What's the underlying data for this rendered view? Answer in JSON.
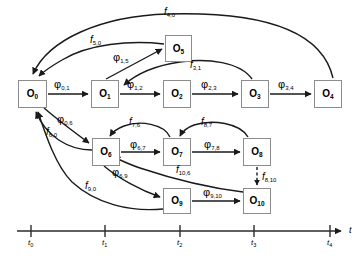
{
  "figure": {
    "type": "state-transition-diagram"
  },
  "nodes": [
    {
      "id": "O0",
      "label": "O",
      "sub": "0",
      "x": 18,
      "y": 80,
      "w": 29,
      "h": 28
    },
    {
      "id": "O1",
      "label": "O",
      "sub": "1",
      "x": 91,
      "y": 80,
      "w": 28,
      "h": 28
    },
    {
      "id": "O2",
      "label": "O",
      "sub": "2",
      "x": 163,
      "y": 80,
      "w": 28,
      "h": 28
    },
    {
      "id": "O3",
      "label": "O",
      "sub": "3",
      "x": 241,
      "y": 80,
      "w": 28,
      "h": 28
    },
    {
      "id": "O4",
      "label": "O",
      "sub": "4",
      "x": 314,
      "y": 80,
      "w": 28,
      "h": 28
    },
    {
      "id": "O5",
      "label": "O",
      "sub": "5",
      "x": 165,
      "y": 35,
      "w": 27,
      "h": 27
    },
    {
      "id": "O6",
      "label": "O",
      "sub": "6",
      "x": 92,
      "y": 138,
      "w": 28,
      "h": 28
    },
    {
      "id": "O7",
      "label": "O",
      "sub": "7",
      "x": 163,
      "y": 138,
      "w": 28,
      "h": 28
    },
    {
      "id": "O8",
      "label": "O",
      "sub": "8",
      "x": 243,
      "y": 138,
      "w": 28,
      "h": 28
    },
    {
      "id": "O9",
      "label": "O",
      "sub": "9",
      "x": 163,
      "y": 188,
      "w": 28,
      "h": 26
    },
    {
      "id": "O10",
      "label": "O",
      "sub": "10",
      "x": 243,
      "y": 188,
      "w": 28,
      "h": 26
    }
  ],
  "edge_labels": [
    {
      "id": "f_4_0",
      "kind": "f",
      "sym": "f",
      "sub": "4,0",
      "x": 164,
      "y": 7
    },
    {
      "id": "f_5_0",
      "kind": "f",
      "sym": "f",
      "sub": "5,0",
      "x": 90,
      "y": 35
    },
    {
      "id": "phi_1_5",
      "kind": "phi",
      "sym": "φ",
      "sub": "1,5",
      "x": 113,
      "y": 52
    },
    {
      "id": "f_3_1",
      "kind": "f",
      "sym": "f",
      "sub": "3,1",
      "x": 190,
      "y": 60
    },
    {
      "id": "phi_0_1",
      "kind": "phi",
      "sym": "φ",
      "sub": "0,1",
      "x": 54,
      "y": 79
    },
    {
      "id": "phi_1_2",
      "kind": "phi",
      "sym": "φ",
      "sub": "1,2",
      "x": 127,
      "y": 79
    },
    {
      "id": "phi_2_3",
      "kind": "phi",
      "sym": "φ",
      "sub": "2,3",
      "x": 201,
      "y": 79
    },
    {
      "id": "phi_3_4",
      "kind": "phi",
      "sym": "φ",
      "sub": "3,4",
      "x": 278,
      "y": 79
    },
    {
      "id": "phi_0_6",
      "kind": "phi",
      "sym": "φ",
      "sub": "0,6",
      "x": 57,
      "y": 114
    },
    {
      "id": "f_6_0",
      "kind": "f",
      "sym": "f",
      "sub": "6,0",
      "x": 46,
      "y": 127
    },
    {
      "id": "f_7_6",
      "kind": "f",
      "sym": "f",
      "sub": "7,6",
      "x": 129,
      "y": 117
    },
    {
      "id": "f_8_7",
      "kind": "f",
      "sym": "f",
      "sub": "8,7",
      "x": 201,
      "y": 117
    },
    {
      "id": "phi_6_7",
      "kind": "phi",
      "sym": "φ",
      "sub": "6,7",
      "x": 130,
      "y": 139
    },
    {
      "id": "phi_7_8",
      "kind": "phi",
      "sym": "φ",
      "sub": "7,8",
      "x": 204,
      "y": 139
    },
    {
      "id": "f_10_6",
      "kind": "f",
      "sym": "f",
      "sub": "10,6",
      "x": 176,
      "y": 165
    },
    {
      "id": "f_8_10",
      "kind": "f",
      "sym": "f",
      "sub": "8,10",
      "x": 262,
      "y": 172
    },
    {
      "id": "phi_6_9",
      "kind": "phi",
      "sym": "φ",
      "sub": "6,9",
      "x": 112,
      "y": 167
    },
    {
      "id": "f_9_0",
      "kind": "f",
      "sym": "f",
      "sub": "9,0",
      "x": 85,
      "y": 181
    },
    {
      "id": "phi_9_10",
      "kind": "phi",
      "sym": "φ",
      "sub": "9,10",
      "x": 203,
      "y": 187
    }
  ],
  "axis": {
    "name": "t",
    "name_x": 349,
    "name_y": 226,
    "line": {
      "x1": 17,
      "y1": 231,
      "x2": 341,
      "y2": 231
    },
    "ticks": [
      {
        "label": "t",
        "sub": "0",
        "x": 31
      },
      {
        "label": "t",
        "sub": "1",
        "x": 105
      },
      {
        "label": "t",
        "sub": "2",
        "x": 180
      },
      {
        "label": "t",
        "sub": "3",
        "x": 254
      },
      {
        "label": "t",
        "sub": "4",
        "x": 330
      }
    ]
  },
  "colors": {
    "stroke": "#1a1a1a",
    "node_border": "#8c8c8c",
    "background": "#ffffff",
    "axis": "#2b2b2b"
  }
}
